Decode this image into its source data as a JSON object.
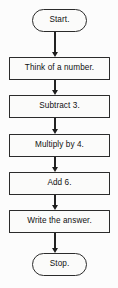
{
  "diagram": {
    "type": "flowchart",
    "orientation": "top-to-bottom",
    "colors": {
      "background": "#fcfcfc",
      "node_fill": "#fbfbfa",
      "border": "#2b2b2b",
      "text": "#111111",
      "arrow": "#1d1d1d"
    },
    "nodes": [
      {
        "id": "start",
        "label": "Start.",
        "shape": "terminator",
        "x": 32,
        "y": 9,
        "w": 55,
        "h": 23
      },
      {
        "id": "think",
        "label": "Think of a number.",
        "shape": "process",
        "x": 9,
        "y": 57,
        "w": 101,
        "h": 23
      },
      {
        "id": "subtract",
        "label": "Subtract 3.",
        "shape": "process",
        "x": 9,
        "y": 95,
        "w": 101,
        "h": 23
      },
      {
        "id": "multiply",
        "label": "Multiply by 4.",
        "shape": "process",
        "x": 9,
        "y": 134,
        "w": 101,
        "h": 23
      },
      {
        "id": "add",
        "label": "Add 6.",
        "shape": "process",
        "x": 9,
        "y": 172,
        "w": 101,
        "h": 23
      },
      {
        "id": "write",
        "label": "Write the answer.",
        "shape": "process",
        "x": 9,
        "y": 210,
        "w": 101,
        "h": 23
      },
      {
        "id": "stop",
        "label": "Stop.",
        "shape": "terminator",
        "x": 32,
        "y": 253,
        "w": 55,
        "h": 23
      }
    ],
    "connectors": [
      {
        "id": "start-to-think",
        "from": "start",
        "to": "think",
        "x": 55,
        "y": 32,
        "h": 25
      },
      {
        "id": "think-to-subtract",
        "from": "think",
        "to": "subtract",
        "x": 55,
        "y": 80,
        "h": 15
      },
      {
        "id": "subtract-to-multiply",
        "from": "subtract",
        "to": "multiply",
        "x": 55,
        "y": 118,
        "h": 16
      },
      {
        "id": "multiply-to-add",
        "from": "multiply",
        "to": "add",
        "x": 55,
        "y": 157,
        "h": 15
      },
      {
        "id": "add-to-write",
        "from": "add",
        "to": "write",
        "x": 55,
        "y": 195,
        "h": 15
      },
      {
        "id": "write-to-stop",
        "from": "write",
        "to": "stop",
        "x": 55,
        "y": 233,
        "h": 20
      }
    ]
  }
}
